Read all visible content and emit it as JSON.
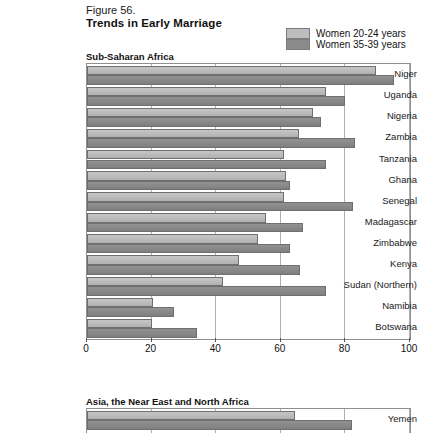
{
  "figure": {
    "number": "Figure 56.",
    "title": "Trends in Early Marriage"
  },
  "legend": {
    "position": "top-right",
    "items": [
      {
        "label": "Women 20-24 years",
        "color": "#bdbdbd",
        "key": "women_20_24"
      },
      {
        "label": "Women 35-39 years",
        "color": "#8a8a8a",
        "key": "women_35_39"
      }
    ]
  },
  "sections": {
    "sub_saharan_africa": "Sub-Saharan Africa",
    "asia_near_east_north_africa": "Asia, the Near East and North Africa"
  },
  "axis": {
    "ticks": [
      "0",
      "20",
      "40",
      "60",
      "80",
      "100"
    ],
    "min": 0,
    "max": 100
  },
  "chart_data": {
    "type": "bar",
    "orientation": "horizontal",
    "title": "Trends in Early Marriage",
    "subtitle": "Figure 56.",
    "xlabel": "",
    "ylabel": "",
    "xlim": [
      0,
      100
    ],
    "grid": true,
    "legend_position": "top-right",
    "series": [
      {
        "name": "Women 20-24 years",
        "color": "#bdbdbd"
      },
      {
        "name": "Women 35-39 years",
        "color": "#8a8a8a"
      }
    ],
    "panels": [
      {
        "name": "Sub-Saharan Africa",
        "categories": [
          "Niger",
          "Uganda",
          "Nigeria",
          "Zambia",
          "Tanzania",
          "Ghana",
          "Senegal",
          "Madagascar",
          "Zimbabwe",
          "Kenya",
          "Sudan (Northern)",
          "Namibia",
          "Botswana"
        ],
        "values": {
          "women_20_24": [
            89.5,
            74,
            70,
            65.5,
            61,
            61.5,
            61,
            55.5,
            53,
            47,
            42,
            20.5,
            20
          ],
          "women_35_39": [
            95,
            80,
            72.5,
            83,
            74,
            63,
            82.5,
            67,
            63,
            66,
            74,
            27,
            34
          ]
        }
      },
      {
        "name": "Asia, the Near East and North Africa",
        "categories": [
          "Yemen"
        ],
        "values": {
          "women_20_24": [
            64.5
          ],
          "women_35_39": [
            82
          ]
        }
      }
    ]
  }
}
